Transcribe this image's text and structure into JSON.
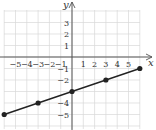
{
  "chart_data": {
    "type": "line",
    "title": "",
    "xlabel": "x",
    "ylabel": "y",
    "xlim": [
      -6.3,
      6.3
    ],
    "ylim": [
      -6,
      4.2
    ],
    "grid": true,
    "x_tick_labels": [
      "-5",
      "-4",
      "-3",
      "-2",
      "-1",
      "1",
      "2",
      "3",
      "4",
      "5"
    ],
    "y_tick_labels": [
      "3",
      "2",
      "1",
      "-1",
      "-2",
      "-4",
      "-5"
    ],
    "series": [
      {
        "name": "line",
        "equation": "y = x/3 - 3",
        "x": [
          -6,
          -3,
          0,
          3,
          6
        ],
        "y": [
          -5,
          -4,
          -3,
          -2,
          -1
        ],
        "markers": true
      }
    ]
  },
  "axes": {
    "x_label": "x",
    "y_label": "y"
  },
  "colors": {
    "grid": "#d8d8d8",
    "axis": "#555555",
    "line": "#222222"
  }
}
